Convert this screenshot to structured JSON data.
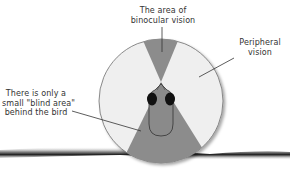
{
  "labels": {
    "binocular": {
      "line1": "The area of",
      "line2": "binocular vision"
    },
    "peripheral": {
      "line1": "Peripheral",
      "line2": "vision"
    },
    "blind": {
      "line1": "There is only a",
      "line2": "small \"blind area\"",
      "line3": "behind the bird"
    }
  },
  "colors": {
    "background": "#ffffff",
    "circle_fill": "#efefef",
    "circle_stroke": "#6e6e6e",
    "wedge_fill": "#8c8c8c",
    "bird_body": "#8a8a8a",
    "bird_eye": "#111111",
    "text": "#333333",
    "perch": "#2a2a2a"
  }
}
